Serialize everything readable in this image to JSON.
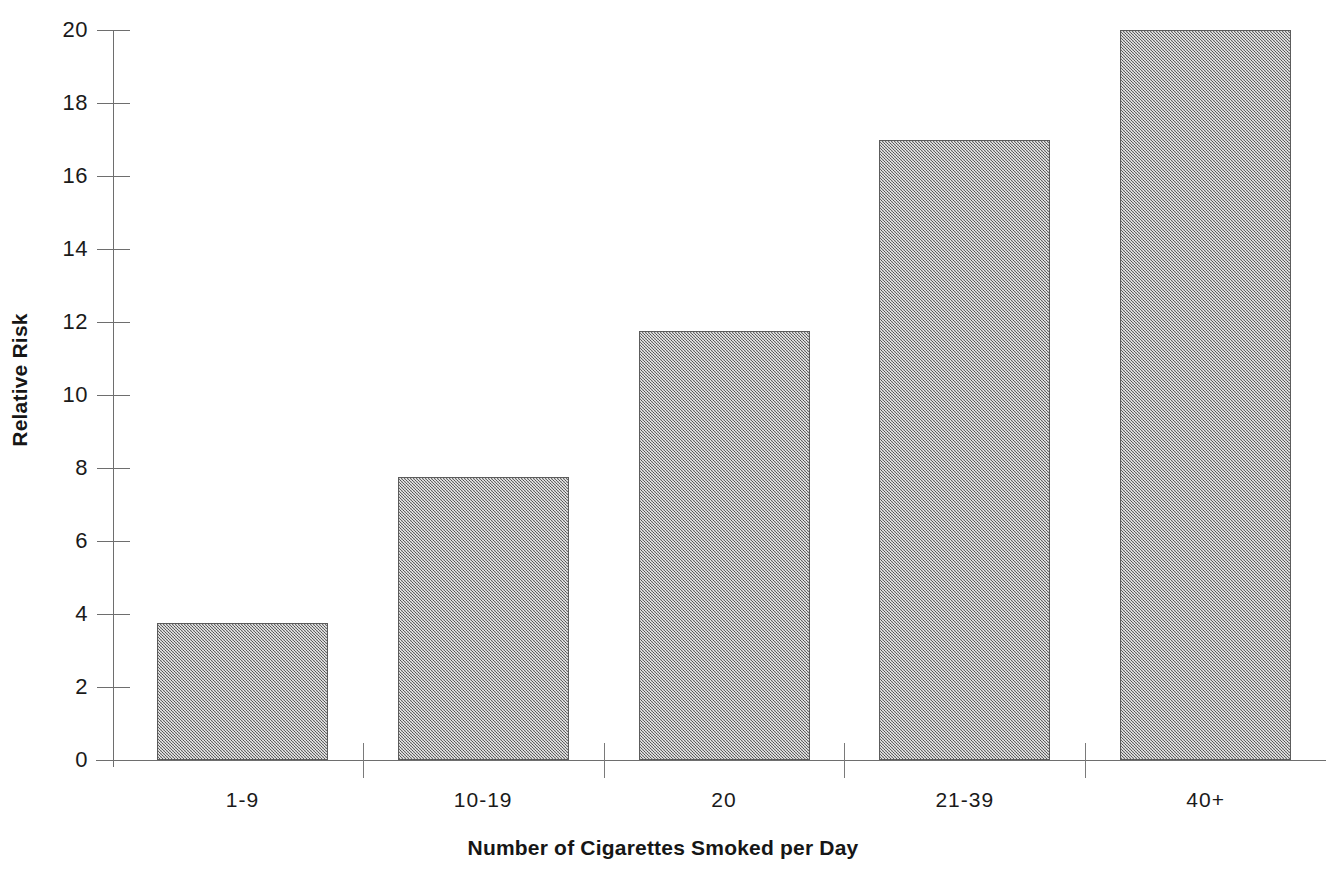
{
  "chart_data": {
    "type": "bar",
    "title": "",
    "subtitle": "",
    "xlabel": "Number of Cigarettes Smoked per Day",
    "ylabel": "Relative Risk",
    "categories": [
      "1-9",
      "10-19",
      "20",
      "21-39",
      "40+"
    ],
    "values": [
      3.75,
      7.75,
      11.75,
      17.0,
      20.0
    ],
    "ylim": [
      0,
      20
    ],
    "ytick_labels": [
      "0",
      "2",
      "4",
      "6",
      "8",
      "10",
      "12",
      "14",
      "16",
      "18",
      "20"
    ],
    "ytick_values": [
      0,
      2,
      4,
      6,
      8,
      10,
      12,
      14,
      16,
      18,
      20
    ],
    "grid": false,
    "legend": null,
    "legend_position": "none",
    "annotations": [],
    "bar_fill_color": "#9c9c9c",
    "bar_border_color": "#5c5c5c",
    "axis_color": "#6e6e6e",
    "text_color": "#1a1a1a",
    "background_color": "#ffffff"
  }
}
